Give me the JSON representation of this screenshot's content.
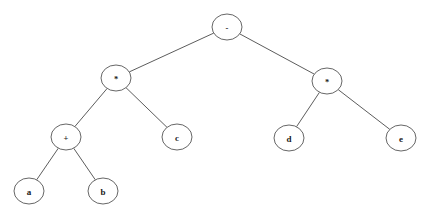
{
  "figure": {
    "name": "binary-expression-tree",
    "background_color": "#ffffff",
    "stroke_color": "#555555",
    "edge_color": "#4a4a4a",
    "label_color": "#1a1a1a"
  },
  "tree": {
    "nodes": [
      {
        "id": "root",
        "label": "-",
        "kind": "operator",
        "cx": 227,
        "cy": 27,
        "rx": 15,
        "ry": 13
      },
      {
        "id": "mul-left",
        "label": "*",
        "kind": "operator",
        "cx": 116,
        "cy": 78,
        "rx": 15,
        "ry": 13
      },
      {
        "id": "mul-right",
        "label": "*",
        "kind": "operator",
        "cx": 327,
        "cy": 81,
        "rx": 15,
        "ry": 13
      },
      {
        "id": "plus",
        "label": "+",
        "kind": "operator",
        "cx": 66,
        "cy": 137,
        "rx": 15,
        "ry": 13
      },
      {
        "id": "leaf-c",
        "label": "c",
        "kind": "operand",
        "cx": 177,
        "cy": 137,
        "rx": 15,
        "ry": 13
      },
      {
        "id": "leaf-d",
        "label": "d",
        "kind": "operand",
        "cx": 289,
        "cy": 138,
        "rx": 15,
        "ry": 13
      },
      {
        "id": "leaf-e",
        "label": "e",
        "kind": "operand",
        "cx": 401,
        "cy": 138,
        "rx": 15,
        "ry": 13
      },
      {
        "id": "leaf-a",
        "label": "a",
        "kind": "operand",
        "cx": 29,
        "cy": 191,
        "rx": 15,
        "ry": 13
      },
      {
        "id": "leaf-b",
        "label": "b",
        "kind": "operand",
        "cx": 103,
        "cy": 191,
        "rx": 15,
        "ry": 13
      }
    ],
    "edges": [
      {
        "from": "root",
        "to": "mul-left"
      },
      {
        "from": "root",
        "to": "mul-right"
      },
      {
        "from": "mul-left",
        "to": "plus"
      },
      {
        "from": "mul-left",
        "to": "leaf-c"
      },
      {
        "from": "mul-right",
        "to": "leaf-d"
      },
      {
        "from": "mul-right",
        "to": "leaf-e"
      },
      {
        "from": "plus",
        "to": "leaf-a"
      },
      {
        "from": "plus",
        "to": "leaf-b"
      }
    ]
  }
}
